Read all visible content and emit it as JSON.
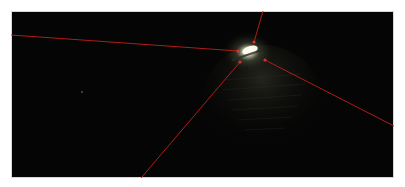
{
  "image": {
    "description": "Dark night scene with a bright light source near center and four red lines converging on it",
    "background": "#050505",
    "frame_border": "#d8d8d8",
    "line_color": "#c0201a",
    "glow_color": "#f4f2d8",
    "light_center": {
      "x": 248,
      "y": 52
    },
    "faint_dot": {
      "x": 82,
      "y": 92
    },
    "lines": [
      {
        "name": "left-line",
        "x1": 11,
        "y1": 35,
        "x2": 238,
        "y2": 51
      },
      {
        "name": "top-line",
        "x1": 263,
        "y1": 11,
        "x2": 254,
        "y2": 42
      },
      {
        "name": "bottom-line",
        "x1": 141,
        "y1": 178,
        "x2": 240,
        "y2": 62
      },
      {
        "name": "right-line",
        "x1": 394,
        "y1": 126,
        "x2": 265,
        "y2": 60
      }
    ]
  }
}
